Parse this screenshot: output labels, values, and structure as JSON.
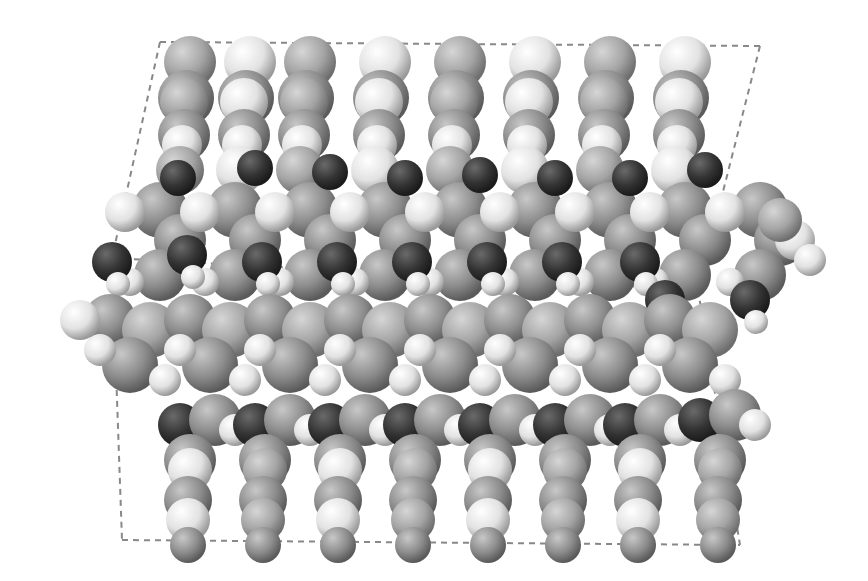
{
  "image": {
    "width": 868,
    "height": 581,
    "background": "#ffffff",
    "description_visible": "",
    "palette": {
      "carbon": "#8a8a8a",
      "carbon_light": "#a8a8a8",
      "hydrogen": "#e8e8e8",
      "oxygen": "#333333",
      "cell_line": "#888888"
    },
    "unit_cell": {
      "top_left": [
        160,
        42
      ],
      "top_right": [
        760,
        46
      ],
      "mid_left": [
        112,
        258
      ],
      "mid_right": [
        698,
        290
      ],
      "bottom_left": [
        122,
        540
      ],
      "bottom_right": [
        740,
        545
      ]
    },
    "top_stacks_x": [
      190,
      250,
      310,
      385,
      460,
      535,
      610,
      685
    ],
    "bottom_stacks_x": [
      190,
      265,
      340,
      415,
      490,
      565,
      640,
      720
    ],
    "middle_band_oxygens_top": [
      [
        178,
        178
      ],
      [
        255,
        168
      ],
      [
        330,
        172
      ],
      [
        405,
        178
      ],
      [
        480,
        175
      ],
      [
        555,
        178
      ],
      [
        630,
        178
      ],
      [
        705,
        170
      ]
    ],
    "middle_band_oxygens_low": [
      [
        112,
        262
      ],
      [
        187,
        255
      ],
      [
        262,
        262
      ],
      [
        337,
        262
      ],
      [
        412,
        262
      ],
      [
        487,
        262
      ],
      [
        562,
        262
      ],
      [
        640,
        262
      ],
      [
        665,
        300
      ],
      [
        750,
        300
      ],
      [
        690,
        345
      ]
    ],
    "lower_oxygens": [
      [
        180,
        425
      ],
      [
        255,
        425
      ],
      [
        330,
        425
      ],
      [
        405,
        425
      ],
      [
        480,
        425
      ],
      [
        555,
        425
      ],
      [
        625,
        425
      ],
      [
        700,
        420
      ]
    ]
  }
}
